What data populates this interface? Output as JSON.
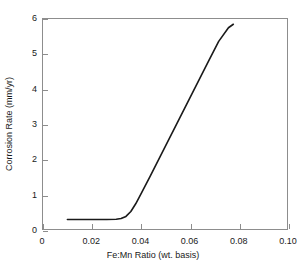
{
  "chart_data": {
    "type": "line",
    "title": "",
    "xlabel": "Fe:Mn Ratio (wt. basis)",
    "ylabel": "Corrosion Rate (mm/yr)",
    "xlim": [
      0,
      0.1
    ],
    "ylim": [
      0,
      6
    ],
    "xticks": [
      0,
      0.02,
      0.04,
      0.06,
      0.08,
      0.1
    ],
    "xticklabels": [
      "0",
      "0.02",
      "0.04",
      "0.06",
      "0.08",
      "0.10"
    ],
    "yticks": [
      0,
      1,
      2,
      3,
      4,
      5,
      6
    ],
    "yticklabels": [
      "0",
      "1",
      "2",
      "3",
      "4",
      "5",
      "6"
    ],
    "grid": false,
    "legend": "none",
    "line_color": "#1a1a1a",
    "line_width": 1.6,
    "series": [
      {
        "name": "Corrosion Rate",
        "x": [
          0.01,
          0.014,
          0.018,
          0.022,
          0.026,
          0.03,
          0.032,
          0.034,
          0.036,
          0.038,
          0.04,
          0.044,
          0.048,
          0.052,
          0.056,
          0.06,
          0.064,
          0.068,
          0.072,
          0.076,
          0.078
        ],
        "y": [
          0.27,
          0.27,
          0.27,
          0.27,
          0.27,
          0.28,
          0.3,
          0.36,
          0.5,
          0.72,
          0.98,
          1.52,
          2.07,
          2.62,
          3.17,
          3.72,
          4.27,
          4.82,
          5.36,
          5.75,
          5.85
        ]
      }
    ]
  },
  "axes": {
    "frame_color": "#8d8d8d"
  }
}
